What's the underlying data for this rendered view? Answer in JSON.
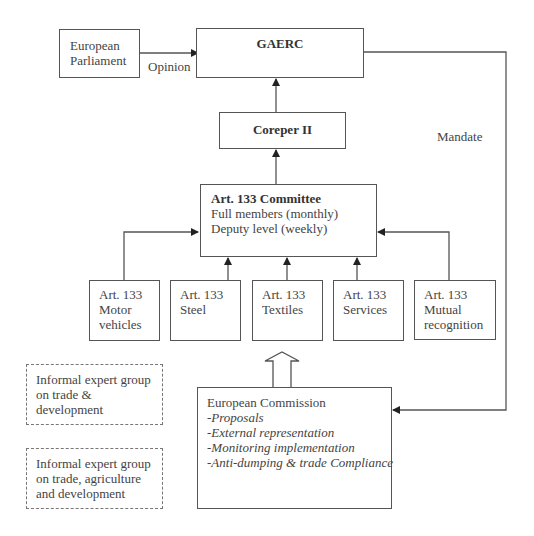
{
  "diagram": {
    "nodes": {
      "european_parliament": {
        "lines": [
          "European",
          "Parliament"
        ]
      },
      "gaerc": {
        "title": "GAERC"
      },
      "coreper": {
        "title": "Coreper II"
      },
      "committee": {
        "title": "Art. 133 Committee",
        "lines": [
          "Full members (monthly)",
          "Deputy level (weekly)"
        ]
      },
      "subcommittees": [
        {
          "lines": [
            "Art. 133",
            "Motor",
            "vehicles"
          ]
        },
        {
          "lines": [
            "Art. 133",
            "Steel"
          ]
        },
        {
          "lines": [
            "Art. 133",
            "Textiles"
          ]
        },
        {
          "lines": [
            "Art. 133",
            "Services"
          ]
        },
        {
          "lines": [
            "Art. 133",
            "Mutual",
            "recognition"
          ]
        }
      ],
      "informal_groups": [
        {
          "lines": [
            "Informal expert group",
            "on trade &",
            "development"
          ]
        },
        {
          "lines": [
            "Informal expert group",
            "on trade, agriculture",
            "and development"
          ]
        }
      ],
      "commission": {
        "title": "European Commission",
        "items": [
          "-Proposals",
          "-External representation",
          "-Monitoring implementation",
          "-Anti-dumping & trade Compliance"
        ]
      }
    },
    "edge_labels": {
      "opinion": "Opinion",
      "mandate": "Mandate"
    }
  }
}
